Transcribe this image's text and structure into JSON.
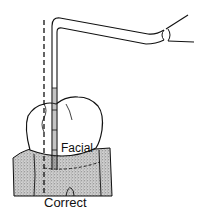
{
  "figure": {
    "type": "dental-probe-placement-diagram",
    "labels": {
      "surface": "Facial",
      "caption": "Correct"
    },
    "colors": {
      "line": "#111111",
      "background": "#ffffff",
      "gingiva_fill": "#bdbdbd",
      "tooth_fill": "#ffffff"
    },
    "elements": [
      "periodontal-probe",
      "probe-handle",
      "dashed-reference-line",
      "tooth-crown",
      "gingiva",
      "gingival-margin-dashed-line",
      "tooth-root-outline"
    ]
  }
}
